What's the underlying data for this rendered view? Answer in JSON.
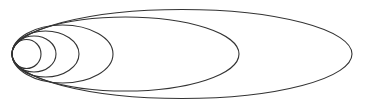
{
  "diagram": {
    "type": "nested-tangent-ellipses",
    "width": 365,
    "height": 107,
    "background": "#ffffff",
    "stroke_color": "#333333",
    "tangent_point": {
      "x": 12,
      "y": 54
    },
    "ellipses": [
      {
        "cx": 26.5,
        "cy": 54,
        "rx": 14.5,
        "ry": 14.5
      },
      {
        "cx": 34,
        "cy": 54,
        "rx": 22,
        "ry": 18
      },
      {
        "cx": 45.5,
        "cy": 54,
        "rx": 33.5,
        "ry": 23
      },
      {
        "cx": 62.5,
        "cy": 54,
        "rx": 50.5,
        "ry": 29
      },
      {
        "cx": 125.5,
        "cy": 54,
        "rx": 113.5,
        "ry": 37
      },
      {
        "cx": 182,
        "cy": 54,
        "rx": 170,
        "ry": 44.5
      }
    ]
  }
}
